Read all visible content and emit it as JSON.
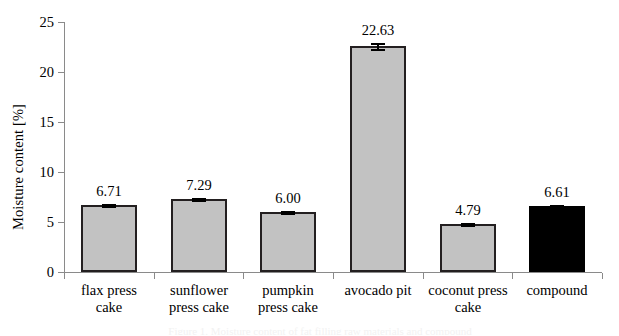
{
  "chart_data": {
    "type": "bar",
    "title": "",
    "xlabel": "",
    "ylabel": "Moisture content [%]",
    "ylim": [
      0,
      25
    ],
    "ytick_labels": [
      "0",
      "5",
      "10",
      "15",
      "20",
      "25"
    ],
    "ytick_values": [
      0,
      5,
      10,
      15,
      20,
      25
    ],
    "grid": false,
    "legend": "none",
    "categories": [
      "flax press cake",
      "sunflower press cake",
      "pumpkin press cake",
      "avocado pit",
      "coconut press cake",
      "compound"
    ],
    "category_lines": [
      [
        "flax press",
        "cake"
      ],
      [
        "sunflower",
        "press cake"
      ],
      [
        "pumpkin",
        "press cake"
      ],
      [
        "avocado pit"
      ],
      [
        "coconut press",
        "cake"
      ],
      [
        "compound"
      ]
    ],
    "values": [
      6.71,
      7.29,
      6.0,
      22.63,
      4.79,
      6.61
    ],
    "value_labels": [
      "6.71",
      "7.29",
      "6.00",
      "22.63",
      "4.79",
      "6.61"
    ],
    "errors": [
      0.12,
      0.1,
      0.06,
      0.28,
      0.09,
      0.1
    ],
    "bar_colors": [
      "#c2c2c2",
      "#c2c2c2",
      "#c2c2c2",
      "#c2c2c2",
      "#c2c2c2",
      "#000000"
    ],
    "bar_border_color": "#231f20"
  },
  "axis": {
    "line_color": "#8a8a8a"
  },
  "caption": {
    "partial_text": "Figure 1. Moisture content of fat filling raw materials and compound"
  }
}
